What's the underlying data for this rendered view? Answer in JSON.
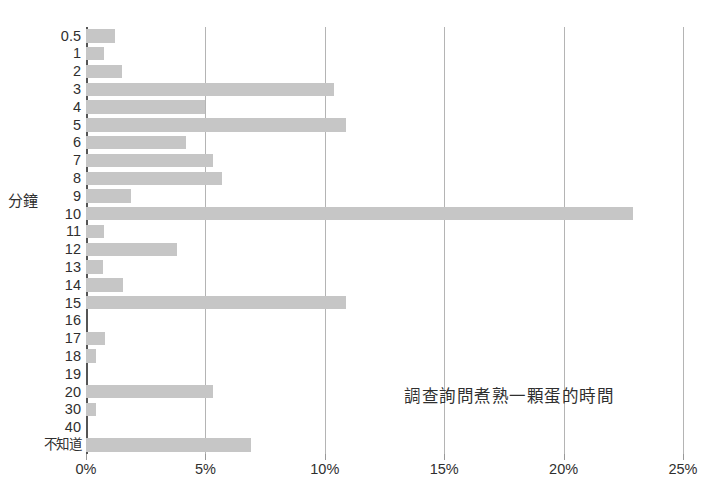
{
  "chart_data": {
    "type": "bar",
    "orientation": "horizontal",
    "title": "",
    "annotation": "調查詢問煮熟一顆蛋的時間",
    "ylabel": "分鐘",
    "xlabel": "",
    "grid": true,
    "legend": false,
    "xlim": [
      0,
      25
    ],
    "xticks": [
      0,
      5,
      10,
      15,
      20,
      25
    ],
    "xticklabels": [
      "0%",
      "5%",
      "10%",
      "15%",
      "20%",
      "25%"
    ],
    "categories": [
      "0.5",
      "1",
      "2",
      "3",
      "4",
      "5",
      "6",
      "7",
      "8",
      "9",
      "10",
      "11",
      "12",
      "13",
      "14",
      "15",
      "16",
      "17",
      "18",
      "19",
      "20",
      "30",
      "40",
      "不知道"
    ],
    "values": [
      1.2,
      0.75,
      1.5,
      10.4,
      5.0,
      10.9,
      4.2,
      5.3,
      5.7,
      1.9,
      22.9,
      0.75,
      3.8,
      0.7,
      1.55,
      10.9,
      0.0,
      0.8,
      0.4,
      0.0,
      5.3,
      0.4,
      0.0,
      6.9
    ],
    "bar_color": "#c6c6c6",
    "grid_color": "#b4b4b4",
    "axis_color": "#555555",
    "text_color": "#2f2f2f"
  }
}
